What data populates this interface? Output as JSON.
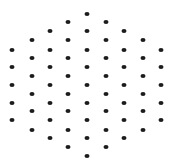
{
  "diagram": {
    "type": "hexagonal-dot-lattice",
    "dot_color": "#1c1c1c",
    "background": "#ffffff",
    "columns_x": [
      12,
      32,
      50,
      68,
      87,
      106,
      124,
      143,
      161
    ],
    "rows": [
      {
        "y": 14,
        "cols": [
          4
        ]
      },
      {
        "y": 22,
        "cols": [
          3,
          5
        ]
      },
      {
        "y": 31,
        "cols": [
          2,
          4,
          6
        ]
      },
      {
        "y": 40,
        "cols": [
          1,
          3,
          5,
          7
        ]
      },
      {
        "y": 50,
        "cols": [
          0,
          2,
          4,
          6,
          8
        ]
      },
      {
        "y": 58,
        "cols": [
          1,
          3,
          5,
          7
        ]
      },
      {
        "y": 67,
        "cols": [
          0,
          2,
          4,
          6,
          8
        ]
      },
      {
        "y": 76,
        "cols": [
          1,
          3,
          5,
          7
        ]
      },
      {
        "y": 85,
        "cols": [
          0,
          2,
          4,
          6,
          8
        ]
      },
      {
        "y": 94,
        "cols": [
          1,
          3,
          5,
          7
        ]
      },
      {
        "y": 103,
        "cols": [
          0,
          2,
          4,
          6,
          8
        ]
      },
      {
        "y": 111,
        "cols": [
          1,
          3,
          5,
          7
        ]
      },
      {
        "y": 120,
        "cols": [
          0,
          2,
          4,
          6,
          8
        ]
      },
      {
        "y": 130,
        "cols": [
          1,
          3,
          5,
          7
        ]
      },
      {
        "y": 138,
        "cols": [
          2,
          4,
          6
        ]
      },
      {
        "y": 147,
        "cols": [
          3,
          5
        ]
      },
      {
        "y": 156,
        "cols": [
          4
        ]
      }
    ],
    "dot_count": 61
  }
}
